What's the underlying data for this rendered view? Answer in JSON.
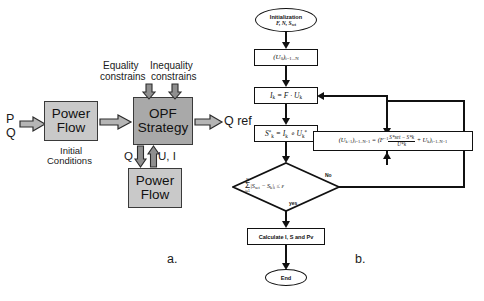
{
  "figure": {
    "panel_a_label": "a.",
    "panel_b_label": "b."
  },
  "block_diagram": {
    "inputs": {
      "p": "P",
      "q": "Q"
    },
    "output": {
      "q_ref": "Q ref"
    },
    "constraints": {
      "equality_line1": "Equality",
      "equality_line2": "constrains",
      "inequality_line1": "Inequality",
      "inequality_line2": "constrains"
    },
    "initial_conditions_line1": "Initial",
    "initial_conditions_line2": "Conditions",
    "feedback": {
      "q": "Q",
      "ui": "U, I"
    },
    "blocks": [
      {
        "id": "power-flow-top",
        "line1": "Power",
        "line2": "Flow",
        "fill": "#c9c9c9"
      },
      {
        "id": "opf-strategy",
        "line1": "OPF",
        "line2": "Strategy",
        "fill": "#a9a9a9"
      },
      {
        "id": "power-flow-bottom",
        "line1": "Power",
        "line2": "Flow",
        "fill": "#c9c9c9"
      }
    ]
  },
  "flowchart": {
    "start": {
      "line1": "Initialization",
      "line2": "F, N, S",
      "line2_sub": "set"
    },
    "step_u0": {
      "main": "(U",
      "main_sub": "0",
      "tail": ")",
      "tail_sub": "i=1...N"
    },
    "step_current": {
      "text": "I",
      "sub": "k",
      "eq": " = F · U",
      "sub2": "k"
    },
    "step_power": {
      "text": "S",
      "sup": "*",
      "sub": "k",
      "eq": " = I",
      "sub2": "k",
      "eq2": " ∘ U",
      "sub3": "k",
      "sup2": "*"
    },
    "decision": {
      "sigma_top": "N",
      "sigma_bot": "i=1",
      "body": "|S",
      "body_sub": "set",
      "minus": " − S",
      "minus_sub": "k",
      "close": "|",
      "close_sub": "i",
      "compare": " ≤ ε",
      "yes_label": "yes",
      "no_label": "No"
    },
    "update": {
      "lhs": "(U",
      "lhs_sub": "k+1",
      "lhs_close": ")",
      "lhs_range": "i=1..N−1",
      "eq": " = (F",
      "eq_sup": "−1",
      "num": "S*set − S*k",
      "den": "U*k",
      "plus": " + U",
      "plus_sub": "k",
      "rhs_close": ")",
      "rhs_range": "i=1..N−1"
    },
    "calculate": {
      "text": "Calculate I, S and Pv"
    },
    "end": {
      "text": "End"
    }
  },
  "colors": {
    "stroke": "#111111",
    "block_light": "#c9c9c9",
    "block_dark": "#a9a9a9",
    "arrow_fill": "#b5b5b5",
    "background": "#ffffff"
  }
}
